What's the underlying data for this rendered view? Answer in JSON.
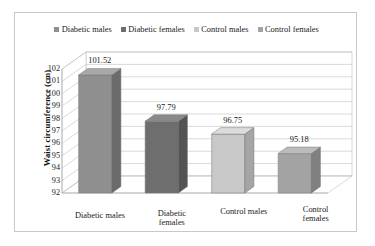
{
  "chart_data": {
    "type": "bar",
    "title": "",
    "subtitle": "",
    "xlabel": "",
    "ylabel": "Waist circumference (cm)",
    "categories": [
      "Diabetic males",
      "Diabetic females",
      "Control males",
      "Control females"
    ],
    "category_labels_wrapped": [
      "Diabetic males",
      "Diabetic\nfemales",
      "Control males",
      "Control\nfemales"
    ],
    "values": [
      101.52,
      97.79,
      96.75,
      95.18
    ],
    "value_labels": [
      "101.52",
      "97.79",
      "96.75",
      "95.18"
    ],
    "ylim": [
      92,
      102
    ],
    "ytick_step": 1,
    "ytick_labels": [
      "102",
      "101",
      "100",
      "99",
      "98",
      "97",
      "96",
      "95",
      "94",
      "93",
      "92"
    ],
    "grid": true,
    "grid_axis": "y",
    "legend_position": "top",
    "legend": [
      {
        "label": "Diabetic males",
        "color": "#8f8f8f"
      },
      {
        "label": "Diabetic females",
        "color": "#6e6e6e"
      },
      {
        "label": "Control males",
        "color": "#c8c8c8"
      },
      {
        "label": "Control females",
        "color": "#a3a3a3"
      }
    ],
    "series": [
      {
        "name": "Waist circumference",
        "points": [
          {
            "category": "Diabetic males",
            "value": 101.52,
            "color": "#8f8f8f",
            "side_color": "#6b6b6b",
            "top_color": "#a8a8a8"
          },
          {
            "category": "Diabetic females",
            "value": 97.79,
            "color": "#6e6e6e",
            "side_color": "#545454",
            "top_color": "#8a8a8a"
          },
          {
            "category": "Control males",
            "value": 96.75,
            "color": "#c8c8c8",
            "side_color": "#a5a5a5",
            "top_color": "#dcdcdc"
          },
          {
            "category": "Control females",
            "value": 95.18,
            "color": "#a3a3a3",
            "side_color": "#808080",
            "top_color": "#bcbcbc"
          }
        ]
      }
    ],
    "style": {
      "three_d": true,
      "plot_background": "#ffffff",
      "gridline_color": "#c0c0c0",
      "axis_color": "#b0b0b0",
      "frame_color": "#c8c8c8"
    }
  }
}
